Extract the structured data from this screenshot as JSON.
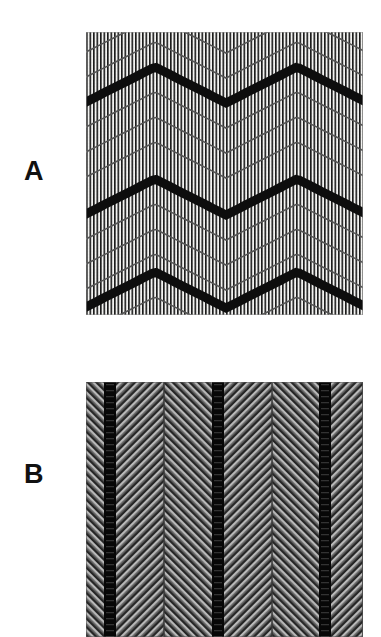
{
  "figure": {
    "background_color": "#ffffff",
    "width": 381,
    "height": 637,
    "panels": [
      {
        "id": "A",
        "label": "A",
        "label_x": 24,
        "label_y": 158,
        "x": 86,
        "y": 32,
        "width": 277,
        "height": 283,
        "description": "warp-faced vertical striped weave overlaid with repeating chevron zigzag lines",
        "background_color": "#f2f2f0",
        "stripe": {
          "orientation": "vertical",
          "period_px": 3.5,
          "dark_color": "#1a1a1a",
          "light_color": "#f4f4f2",
          "duty_cycle": 0.46
        },
        "chevron": {
          "period_x_px": 142,
          "row_spacing_px": 100,
          "peak_offset_x_px": 69,
          "amplitude_px": 36,
          "thick_rows_y": [
            35,
            147,
            240
          ],
          "thick_line_width_px": 9,
          "thick_line_color": "#0d0d0d",
          "thin_line_width_px": 1.6,
          "thin_line_color": "#555555",
          "thin_rows_per_gap": 3,
          "step_px": 3.5
        }
      },
      {
        "id": "B",
        "label": "B",
        "label_x": 24,
        "label_y": 461,
        "x": 86,
        "y": 382,
        "width": 277,
        "height": 255,
        "description": "dark herringbone twill weave with diagonal hatching reversing at seams and heavy dark vertical warp bands",
        "background_color": "#2a2a2a",
        "twill": {
          "diagonal_period_px": 6,
          "diagonal_angle_deg": 45,
          "light_color": "#b4b4b4",
          "dark_color": "#1e1e1e",
          "mid_color": "#6e6e6e"
        },
        "bands": {
          "dark_band_color": "#070707",
          "dark_band_width_px": 12,
          "dark_band_centers_x": [
            24,
            132,
            239
          ],
          "seam_color": "#3a3a3a",
          "seam_width_px": 2,
          "seam_centers_x": [
            78,
            186,
            277
          ],
          "reversal_centers_x": [
            24,
            78,
            132,
            186,
            239
          ]
        }
      }
    ]
  }
}
